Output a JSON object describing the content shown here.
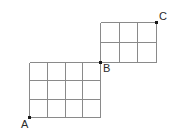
{
  "figure": {
    "background_color": "#ffffff",
    "grid_line_color": "#8a8a8a",
    "grid_line_width": 1,
    "vertex_dot_color": "#1a1a1a",
    "vertex_dot_size": 3,
    "label_color": "#2b2b2b",
    "label_font_size": 11
  },
  "grids": [
    {
      "name": "lower-grid",
      "columns": 4,
      "rows": 3,
      "x0": 29,
      "y0": 62,
      "x1": 100,
      "y1": 117,
      "cell_width": 17.75,
      "cell_height": 18.3333
    },
    {
      "name": "upper-grid",
      "columns": 3,
      "rows": 2,
      "x0": 100,
      "y0": 22,
      "x1": 156,
      "y1": 62,
      "cell_width": 18.6667,
      "cell_height": 20
    }
  ],
  "vertices": [
    {
      "id": "A",
      "label": "A",
      "x": 29,
      "y": 117,
      "label_x": 21,
      "label_y": 119
    },
    {
      "id": "B",
      "label": "B",
      "x": 100,
      "y": 62,
      "label_x": 103,
      "label_y": 63
    },
    {
      "id": "C",
      "label": "C",
      "x": 156,
      "y": 22,
      "label_x": 159,
      "label_y": 11
    }
  ],
  "chart_data": {
    "type": "diagram",
    "title": "",
    "shapes": [
      {
        "kind": "grid",
        "name": "lower-grid",
        "columns": 4,
        "rows": 3,
        "corner_bottom_left": [
          29,
          117
        ],
        "corner_top_right": [
          100,
          62
        ]
      },
      {
        "kind": "grid",
        "name": "upper-grid",
        "columns": 3,
        "rows": 2,
        "corner_bottom_left": [
          100,
          62
        ],
        "corner_top_right": [
          156,
          22
        ]
      }
    ],
    "points": [
      {
        "label": "A",
        "x": 29,
        "y": 117
      },
      {
        "label": "B",
        "x": 100,
        "y": 62
      },
      {
        "label": "C",
        "x": 156,
        "y": 22
      }
    ]
  }
}
